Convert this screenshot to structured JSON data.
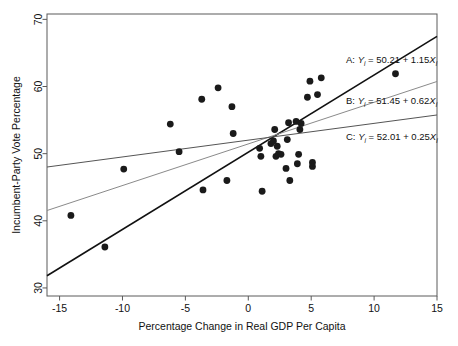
{
  "figure": {
    "type": "scatter-with-regression-lines",
    "background": "#ffffff"
  },
  "axes": {
    "x_title": "Percentage Change in Real GDP Per Capita",
    "y_title": "Incumbent-Party Vote Percentage",
    "x_ticks": [
      "-15",
      "-10",
      "-5",
      "0",
      "5",
      "10",
      "15"
    ],
    "y_ticks": [
      "30",
      "40",
      "50",
      "60",
      "70"
    ]
  },
  "annotations": [
    {
      "key": "A",
      "label": "A:",
      "y_sym": "Y",
      "sub_i": "i",
      "eq": " = 50.21 + 1.15",
      "x_sym": "X",
      "full": "A:  Yi = 50.21 + 1.15Xi",
      "color": "#111111"
    },
    {
      "key": "B",
      "label": "B:",
      "y_sym": "Y",
      "sub_i": "i",
      "eq": " = 51.45 + 0.62",
      "x_sym": "X",
      "full": "B:  Yi = 51.45 + 0.62Xi",
      "color": "#111111"
    },
    {
      "key": "C",
      "label": "C:",
      "y_sym": "Y",
      "sub_i": "i",
      "eq": " = 52.01 + 0.25",
      "x_sym": "X",
      "full": "C:  Yi = 52.01 + 0.25Xi",
      "color": "#111111"
    }
  ],
  "chart_data": {
    "type": "scatter",
    "title": "",
    "xlabel": "Percentage Change in Real GDP Per Capita",
    "ylabel": "Incumbent-Party Vote Percentage",
    "xlim": [
      -16.0,
      15.0
    ],
    "ylim": [
      28.8,
      70.8
    ],
    "xticks": [
      -15,
      -10,
      -5,
      0,
      5,
      10,
      15
    ],
    "yticks": [
      30,
      40,
      50,
      60,
      70
    ],
    "grid": false,
    "legend": "annotations inside plot, upper right",
    "points": [
      [
        -14.1,
        40.8
      ],
      [
        -11.4,
        36.1
      ],
      [
        -9.9,
        47.7
      ],
      [
        -6.2,
        54.4
      ],
      [
        -5.5,
        50.3
      ],
      [
        -3.7,
        58.1
      ],
      [
        -3.6,
        44.6
      ],
      [
        -2.4,
        59.8
      ],
      [
        -1.7,
        46.0
      ],
      [
        -1.3,
        57.0
      ],
      [
        -1.2,
        53.0
      ],
      [
        0.9,
        50.8
      ],
      [
        1.0,
        49.6
      ],
      [
        1.1,
        44.4
      ],
      [
        1.8,
        51.5
      ],
      [
        2.0,
        51.9
      ],
      [
        2.1,
        53.6
      ],
      [
        2.2,
        49.6
      ],
      [
        2.3,
        51.1
      ],
      [
        2.4,
        50.0
      ],
      [
        2.6,
        49.9
      ],
      [
        3.0,
        47.8
      ],
      [
        3.1,
        52.1
      ],
      [
        3.2,
        54.6
      ],
      [
        3.3,
        46.0
      ],
      [
        3.8,
        54.8
      ],
      [
        3.9,
        48.5
      ],
      [
        4.0,
        49.9
      ],
      [
        4.1,
        53.6
      ],
      [
        4.2,
        54.5
      ],
      [
        4.7,
        58.4
      ],
      [
        4.9,
        60.8
      ],
      [
        5.1,
        48.7
      ],
      [
        5.1,
        48.1
      ],
      [
        5.5,
        58.8
      ],
      [
        5.8,
        61.3
      ],
      [
        11.7,
        61.9
      ]
    ],
    "series_lines": [
      {
        "name": "A",
        "intercept": 50.21,
        "slope": 1.15,
        "color": "#111111",
        "width": 1.6
      },
      {
        "name": "B",
        "intercept": 51.45,
        "slope": 0.62,
        "color": "#8a8a8a",
        "width": 1.0
      },
      {
        "name": "C",
        "intercept": 52.01,
        "slope": 0.25,
        "color": "#555555",
        "width": 1.0
      }
    ],
    "point_color": "#1a1a1a",
    "point_radius_px": 3.4
  }
}
